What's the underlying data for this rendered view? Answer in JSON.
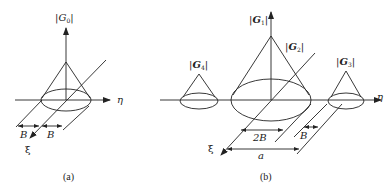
{
  "figure": {
    "panel_a": {
      "caption": "(a)",
      "vertical_axis_label": {
        "bar_left": "|",
        "symbol": "G",
        "subscript": "0",
        "bar_right": "|"
      },
      "eta_label": "η",
      "xi_label": "ξ",
      "dimension_left": "B",
      "dimension_right": "B"
    },
    "panel_b": {
      "caption": "(b)",
      "g1_label": {
        "bar_left": "|",
        "symbol": "G",
        "subscript": "1",
        "bar_right": "|"
      },
      "g2_label": {
        "bar_left": "|",
        "symbol": "G",
        "subscript": "2",
        "bar_right": "|"
      },
      "g3_label": {
        "bar_left": "|",
        "symbol": "G",
        "subscript": "3",
        "bar_right": "|"
      },
      "g4_label": {
        "bar_left": "|",
        "symbol": "G",
        "subscript": "4",
        "bar_right": "|"
      },
      "eta_label": "η",
      "xi_label": "ξ",
      "dimension_2b": "2B",
      "dimension_b": "B",
      "dimension_a": "a"
    },
    "colors": {
      "stroke": "#222222",
      "background": "#ffffff"
    }
  }
}
